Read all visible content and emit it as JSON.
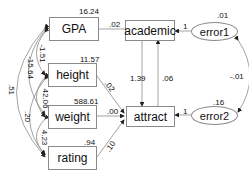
{
  "diagram": {
    "type": "path-diagram",
    "observed": {
      "gpa": {
        "label": "GPA",
        "variance": "16.24"
      },
      "height": {
        "label": "height",
        "variance": "11.57"
      },
      "weight": {
        "label": "weight",
        "variance": "588.61"
      },
      "rating": {
        "label": "rating",
        "variance": ".94"
      },
      "academic": {
        "label": "academic"
      },
      "attract": {
        "label": "attract"
      }
    },
    "errors": {
      "error1": {
        "label": "error1",
        "variance": ".01",
        "path": "1"
      },
      "error2": {
        "label": "error2",
        "variance": ".16",
        "path": "1"
      }
    },
    "paths": {
      "gpa_academic": ".02",
      "height_attract": ".02",
      "weight_attract": ".00",
      "rating_attract": ".10",
      "academic_attract": "1.39",
      "attract_academic": ".06"
    },
    "covariances": {
      "gpa_height": "-1.51",
      "gpa_weight": "-15.64",
      "gpa_rating": ".51",
      "height_weight": "42.06",
      "height_rating": ".20",
      "weight_rating": "4.23",
      "error1_error2": "-.01"
    },
    "colors": {
      "line": "#8a8a8a",
      "text": "#111111"
    }
  }
}
